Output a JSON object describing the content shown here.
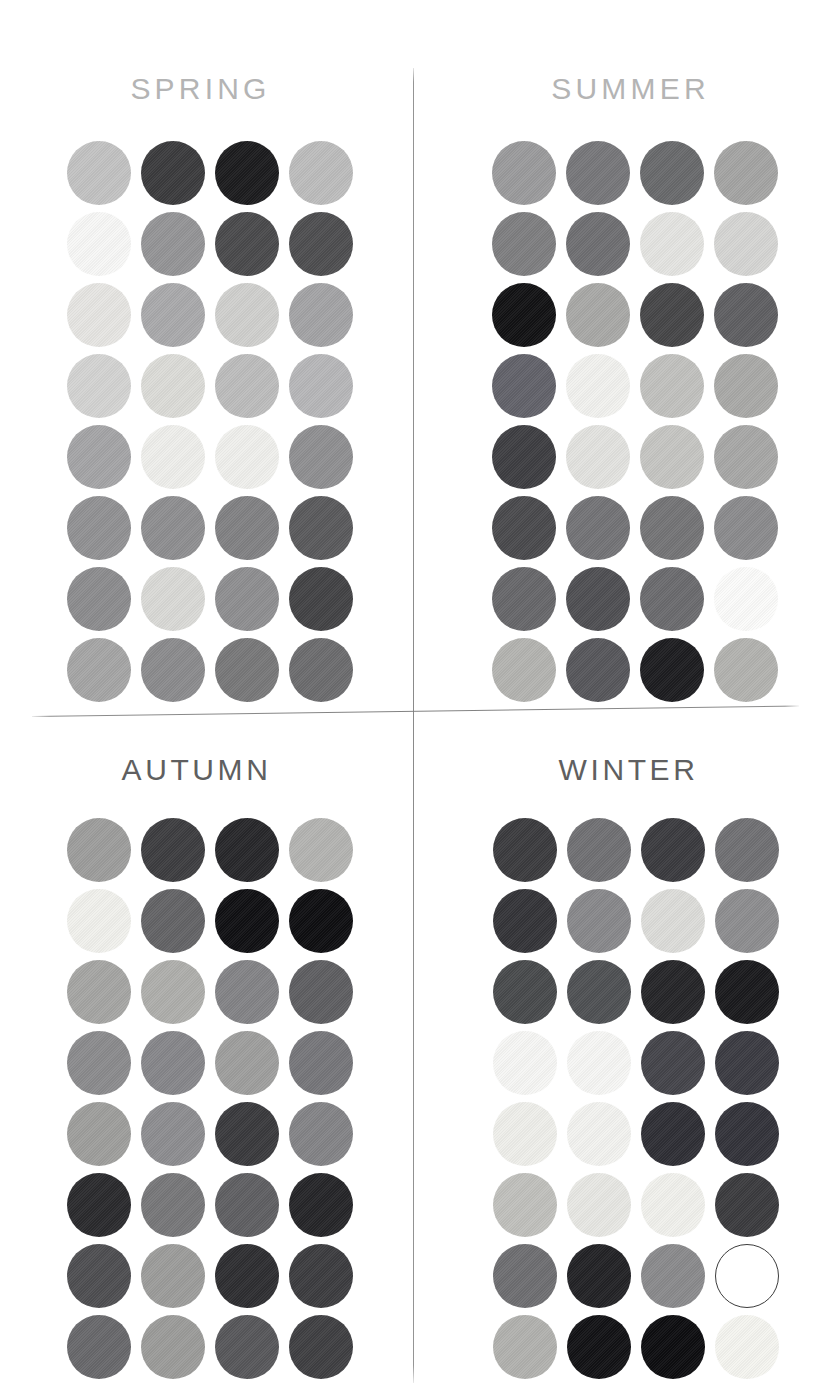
{
  "page": {
    "background": "#ffffff",
    "divider_color": "#808080"
  },
  "panels": [
    {
      "id": "spring",
      "title": "SPRING",
      "title_color": "#b4b4b4",
      "rows": 8,
      "cols": 4,
      "swatches": [
        "#c2c2c2",
        "#3b3b3d",
        "#1c1c1e",
        "#bcbcbc",
        "#f7f7f6",
        "#949496",
        "#4a4a4c",
        "#4e4e50",
        "#e6e5e2",
        "#a9a9ab",
        "#cfcfcd",
        "#a3a3a5",
        "#d3d3d2",
        "#dbdbd7",
        "#bcbcbc",
        "#b6b6b8",
        "#a4a4a6",
        "#eeeeeb",
        "#efefec",
        "#8f8f91",
        "#919193",
        "#8e8e90",
        "#818183",
        "#5a5a5c",
        "#8c8c8e",
        "#d9d9d6",
        "#8e8e90",
        "#434345",
        "#a5a5a5",
        "#8b8b8d",
        "#787879",
        "#6c6c6e"
      ]
    },
    {
      "id": "summer",
      "title": "SUMMER",
      "title_color": "#b4b4b4",
      "rows": 8,
      "cols": 4,
      "swatches": [
        "#9a9a9c",
        "#77777a",
        "#696a6c",
        "#a4a4a3",
        "#7e7e80",
        "#6f6f72",
        "#e4e4e1",
        "#d5d5d3",
        "#121214",
        "#a8a8a6",
        "#464648",
        "#5f5f62",
        "#62626a",
        "#f1f1ee",
        "#c1c1be",
        "#a9a9a7",
        "#3e3e42",
        "#e2e2df",
        "#c5c5c2",
        "#a7a7a6",
        "#4a4a4d",
        "#737376",
        "#747476",
        "#8b8b8d",
        "#67676a",
        "#4f4f53",
        "#6b6b6e",
        "#fbfbfa",
        "#b3b3b0",
        "#57575b",
        "#1d1d20",
        "#b2b2af"
      ]
    },
    {
      "id": "autumn",
      "title": "AUTUMN",
      "title_color": "#5f5f60",
      "rows": 8,
      "cols": 4,
      "swatches": [
        "#9d9d9c",
        "#3d3d40",
        "#27272a",
        "#b3b3b1",
        "#f0f0ec",
        "#636366",
        "#101013",
        "#0e0e11",
        "#a5a5a3",
        "#aeaeab",
        "#838386",
        "#5e5e61",
        "#8b8b8d",
        "#86868a",
        "#9e9e9d",
        "#76767a",
        "#9e9e9c",
        "#8d8d90",
        "#3a3a3d",
        "#838386",
        "#2a2a2d",
        "#777779",
        "#5f5f62",
        "#252528",
        "#4e4e51",
        "#9c9c9a",
        "#2e2e31",
        "#3c3c3f",
        "#68686b",
        "#9b9b99",
        "#57575a",
        "#3f3f42"
      ]
    },
    {
      "id": "winter",
      "title": "WINTER",
      "title_color": "#5f5f60",
      "rows": 8,
      "cols": 4,
      "swatches": [
        "#3b3b3e",
        "#707073",
        "#3b3b3f",
        "#707073",
        "#343438",
        "#88888b",
        "#dcdcd9",
        "#8d8d8f",
        "#484a4c",
        "#4f5154",
        "#252528",
        "#1a1a1d",
        "#f6f6f4",
        "#f6f6f4",
        "#44444a",
        "#3b3b42",
        "#eeeeea",
        "#f2f2ef",
        "#2f2f35",
        "#33333a",
        "#c0c0bc",
        "#e7e7e3",
        "#f0f0ec",
        "#3b3b3e",
        "#6e6e71",
        "#222225",
        "#8a8a8c",
        "#ffffff",
        "#b1b1ae",
        "#121215",
        "#0d0d10",
        "#f4f4ef"
      ],
      "outlined_indexes": [
        27
      ]
    }
  ]
}
